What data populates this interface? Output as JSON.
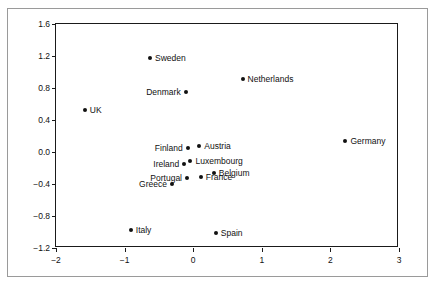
{
  "chart_data": {
    "type": "scatter",
    "title": "",
    "xlabel": "",
    "ylabel": "",
    "xlim": [
      -2,
      3
    ],
    "ylim": [
      -1.2,
      1.6
    ],
    "grid": false,
    "legend": "none",
    "xticks": [
      "-2",
      "-1",
      "0",
      "1",
      "2",
      "3"
    ],
    "xtick_values": [
      -2,
      -1,
      0,
      1,
      2,
      3
    ],
    "yticks": [
      "1.6",
      "1.2",
      "0.8",
      "0.4",
      "0.0",
      "-0.4",
      "-0.8",
      "-1.2"
    ],
    "ytick_values": [
      1.6,
      1.2,
      0.8,
      0.4,
      0.0,
      -0.4,
      -0.8,
      -1.2
    ],
    "marker_color": "#111111",
    "axis_color": "#1a1a1a",
    "points": [
      {
        "label": "Sweden",
        "x": -0.63,
        "y": 1.17,
        "label_side": "right"
      },
      {
        "label": "Netherlands",
        "x": 0.72,
        "y": 0.91,
        "label_side": "right"
      },
      {
        "label": "Denmark",
        "x": -0.11,
        "y": 0.75,
        "label_side": "left"
      },
      {
        "label": "UK",
        "x": -1.58,
        "y": 0.53,
        "label_side": "right"
      },
      {
        "label": "Germany",
        "x": 2.22,
        "y": 0.14,
        "label_side": "right"
      },
      {
        "label": "Finland",
        "x": -0.08,
        "y": 0.05,
        "label_side": "left"
      },
      {
        "label": "Austria",
        "x": 0.09,
        "y": 0.07,
        "label_side": "right"
      },
      {
        "label": "Ireland",
        "x": -0.13,
        "y": -0.15,
        "label_side": "left"
      },
      {
        "label": "Luxembourg",
        "x": -0.04,
        "y": -0.11,
        "label_side": "right"
      },
      {
        "label": "Belgium",
        "x": 0.3,
        "y": -0.26,
        "label_side": "right"
      },
      {
        "label": "Portugal",
        "x": -0.09,
        "y": -0.33,
        "label_side": "left"
      },
      {
        "label": "France",
        "x": 0.11,
        "y": -0.31,
        "label_side": "right"
      },
      {
        "label": "Greece",
        "x": -0.31,
        "y": -0.4,
        "label_side": "left"
      },
      {
        "label": "Italy",
        "x": -0.91,
        "y": -0.97,
        "label_side": "right"
      },
      {
        "label": "Spain",
        "x": 0.33,
        "y": -1.01,
        "label_side": "right"
      }
    ]
  }
}
